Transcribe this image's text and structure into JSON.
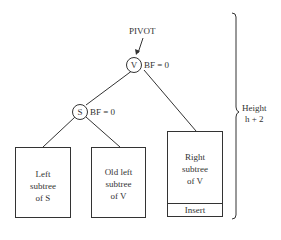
{
  "pivot_label": "PIVOT",
  "nodes": {
    "v": {
      "label": "V",
      "bf": "BF = 0"
    },
    "s": {
      "label": "S",
      "bf": "BF = 0"
    }
  },
  "subtrees": {
    "left_s": {
      "line1": "Left",
      "line2": "subtree",
      "line3": "of S"
    },
    "old_left_v": {
      "line1": "Old left",
      "line2": "subtree",
      "line3": "of V"
    },
    "right_v": {
      "line1": "Right",
      "line2": "subtree",
      "line3": "of V",
      "insert": "Insert"
    }
  },
  "height_label": {
    "line1": "Height",
    "line2": "h + 2"
  }
}
